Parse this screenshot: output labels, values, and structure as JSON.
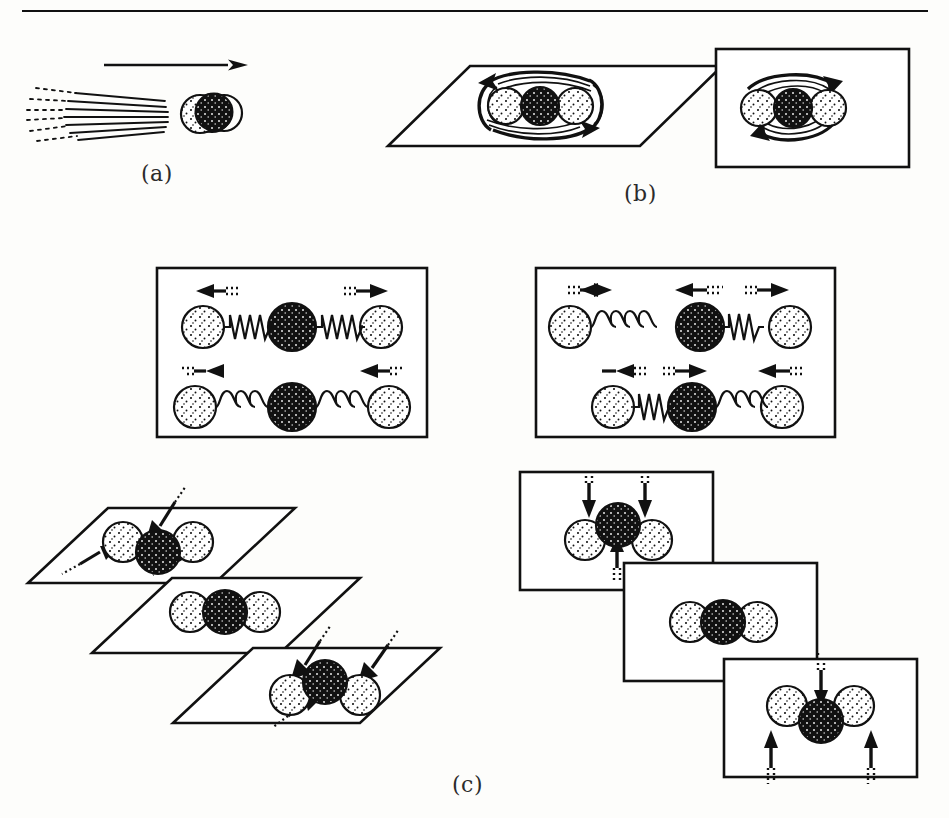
{
  "figure": {
    "panels": [
      {
        "id": "a",
        "label": "(a)",
        "motion_type": "translation",
        "description": "Molecule moving through space with motion blur trail and direction arrow",
        "arrow_direction": "right"
      },
      {
        "id": "b",
        "label": "(b)",
        "motion_type": "rotation",
        "description": "Molecule rotating about axes shown in two reference planes",
        "views": [
          {
            "frame": "parallelogram-plane",
            "rotation_sense": "counterclockwise"
          },
          {
            "frame": "rectangle-plane",
            "rotation_sense": "clockwise"
          }
        ]
      },
      {
        "id": "c",
        "label": "(c)",
        "motion_type": "vibration",
        "description": "Normal modes of vibration of a linear triatomic molecule",
        "modes": [
          {
            "name": "symmetric-stretch",
            "frame": "rectangle",
            "phases": [
              {
                "spring_state": "compressed",
                "outer_atoms": "outward",
                "center_atom": "stationary"
              },
              {
                "spring_state": "stretched",
                "outer_atoms": "inward",
                "center_atom": "stationary"
              }
            ]
          },
          {
            "name": "asymmetric-stretch",
            "frame": "rectangle",
            "phases": [
              {
                "spring_state": "left-stretched-right-compressed",
                "outer_atoms": "right",
                "center_atom": "left"
              },
              {
                "spring_state": "left-compressed-right-stretched",
                "outer_atoms": "left",
                "center_atom": "right"
              }
            ]
          },
          {
            "name": "in-plane-bend",
            "frame": "parallelogram-plane",
            "phases": [
              {
                "geometry": "bent",
                "center_atom": "down",
                "outer_atoms": "up"
              },
              {
                "geometry": "linear",
                "center_atom": "equilibrium",
                "outer_atoms": "equilibrium"
              },
              {
                "geometry": "bent",
                "center_atom": "up",
                "outer_atoms": "down"
              }
            ]
          },
          {
            "name": "out-of-plane-bend",
            "frame": "rectangle",
            "phases": [
              {
                "geometry": "bent",
                "center_atom": "up",
                "outer_atoms": "down"
              },
              {
                "geometry": "linear",
                "center_atom": "equilibrium",
                "outer_atoms": "equilibrium"
              },
              {
                "geometry": "bent",
                "center_atom": "down",
                "outer_atoms": "up"
              }
            ]
          }
        ]
      }
    ],
    "molecule": {
      "atom_count": 3,
      "geometry": "linear",
      "center_atom_shading": "dark",
      "outer_atom_shading": "light-stippled"
    },
    "colors": {
      "ink": "#111111",
      "paper": "#fdfdfb",
      "atom_light": "#ffffff",
      "atom_dark": "#111111"
    }
  }
}
